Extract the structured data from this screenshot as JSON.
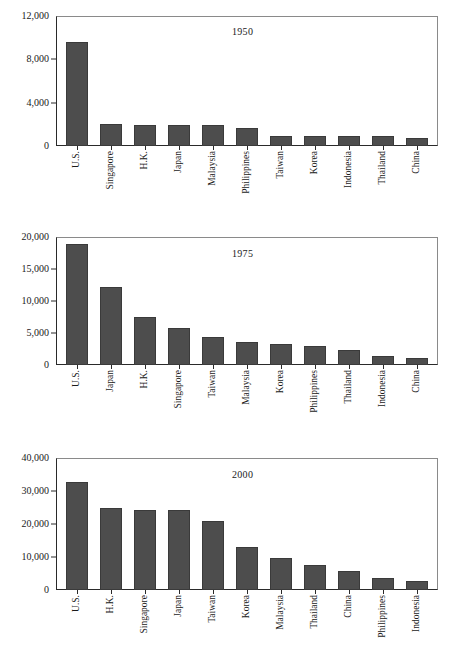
{
  "chart_data": [
    {
      "type": "bar",
      "title": "1950",
      "xlabel": "",
      "ylabel": "",
      "ylim": [
        0,
        12000
      ],
      "yticks": [
        0,
        4000,
        8000,
        12000
      ],
      "ytick_labels": [
        "0",
        "4,000",
        "8,000",
        "12,000"
      ],
      "grid": false,
      "legend": "none",
      "bar_color": "#4d4d4d",
      "categories": [
        "U.S.",
        "Singapore",
        "H.K.",
        "Japan",
        "Malaysia",
        "Philippines",
        "Taiwan",
        "Korea",
        "Indonesia",
        "Thailand",
        "China"
      ],
      "values": [
        9700,
        2060,
        2000,
        1930,
        1920,
        1720,
        960,
        950,
        950,
        930,
        750
      ]
    },
    {
      "type": "bar",
      "title": "1975",
      "xlabel": "",
      "ylabel": "",
      "ylim": [
        0,
        20000
      ],
      "yticks": [
        0,
        5000,
        10000,
        15000,
        20000
      ],
      "ytick_labels": [
        "0",
        "5,000",
        "10,000",
        "15,000",
        "20,000"
      ],
      "grid": false,
      "legend": "none",
      "bar_color": "#4d4d4d",
      "categories": [
        "U.S.",
        "Japan",
        "H.K.",
        "Singapore",
        "Taiwan",
        "Malaysia",
        "Korea",
        "Philippines",
        "Thailand",
        "Indonesia",
        "China"
      ],
      "values": [
        19000,
        12300,
        7600,
        5900,
        4400,
        3700,
        3300,
        3050,
        2400,
        1450,
        1150
      ]
    },
    {
      "type": "bar",
      "title": "2000",
      "xlabel": "",
      "ylabel": "",
      "ylim": [
        0,
        40000
      ],
      "yticks": [
        0,
        10000,
        20000,
        30000,
        40000
      ],
      "ytick_labels": [
        "0",
        "10,000",
        "20,000",
        "30,000",
        "40,000"
      ],
      "grid": false,
      "legend": "none",
      "bar_color": "#4d4d4d",
      "categories": [
        "U.S.",
        "H.K.",
        "Singapore",
        "Japan",
        "Taiwan",
        "Korea",
        "Malaysia",
        "Thailand",
        "China",
        "Philippines",
        "Indonesia"
      ],
      "values": [
        33000,
        25000,
        24500,
        24300,
        21000,
        13200,
        9900,
        7700,
        5700,
        3600,
        2700
      ]
    }
  ]
}
